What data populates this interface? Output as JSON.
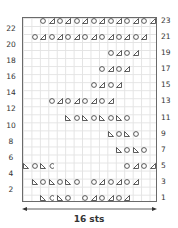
{
  "chart_data": {
    "type": "table",
    "columns": 16,
    "rows": 23,
    "width_label": "16 sts",
    "row_labels_right": [
      "1",
      "3",
      "5",
      "7",
      "9",
      "11",
      "13",
      "15",
      "17",
      "19",
      "21",
      "23"
    ],
    "row_labels_left": [
      "2",
      "4",
      "6",
      "8",
      "10",
      "12",
      "14",
      "16",
      "18",
      "20",
      "22"
    ],
    "legend_symbols": {
      "O": "yarn-over (circle)",
      "D": "right-leaning decrease (triangle ◿)",
      "L": "left-leaning decrease (triangle ◺)",
      "C": "open circle variant (C)"
    },
    "chart_rows": [
      {
        "row": 23,
        "start_col": 3,
        "symbols": "ODODODODODODOD"
      },
      {
        "row": 21,
        "start_col": 2,
        "symbols": "ODODODODODODOD"
      },
      {
        "row": 19,
        "start_col": 11,
        "symbols": "ODOD"
      },
      {
        "row": 17,
        "start_col": 10,
        "symbols": "ODOD"
      },
      {
        "row": 15,
        "start_col": 9,
        "symbols": "ODOD"
      },
      {
        "row": 13,
        "start_col": 4,
        "symbols": "ODODODOD"
      },
      {
        "row": 11,
        "start_col": 6,
        "symbols": "LOLOLOLO"
      },
      {
        "row": 9,
        "start_col": 11,
        "symbols": "LOLO"
      },
      {
        "row": 7,
        "start_col": 12,
        "symbols": "LOLO"
      },
      {
        "row": 5,
        "start_col": 1,
        "symbols": "LOLC"
      },
      {
        "row": 5,
        "start_col": 13,
        "symbols": "ODOD"
      },
      {
        "row": 3,
        "start_col": 2,
        "symbols": "LOLOLO"
      },
      {
        "row": 3,
        "start_col": 9,
        "symbols": "ODODOD"
      },
      {
        "row": 1,
        "start_col": 3,
        "symbols": "LCLO"
      },
      {
        "row": 1,
        "start_col": 8,
        "symbols": "ODODOD"
      }
    ],
    "grid": true
  },
  "colors": {
    "grid_line": "#e3e3e3",
    "border": "#6a6a6a",
    "symbol": "#333333"
  }
}
